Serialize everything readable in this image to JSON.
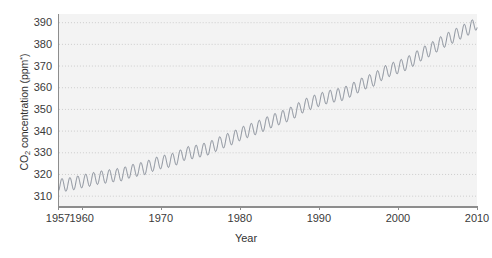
{
  "chart_data": {
    "type": "line",
    "title": "",
    "subtitle": "",
    "xlabel": "Year",
    "ylabel": "CO2 concentration (ppm*)",
    "ylabel_parts": {
      "pre": "CO",
      "sub": "2",
      "mid": " concentration (ppm",
      "sup": "*",
      "post": ")"
    },
    "xlim": [
      1957,
      2010
    ],
    "ylim": [
      305,
      394
    ],
    "grid": true,
    "grid_style": "dotted",
    "legend": "none",
    "xticks": [
      1957,
      1960,
      1970,
      1980,
      1990,
      2000,
      2010
    ],
    "xticklabels": [
      "1957",
      "1960",
      "1970",
      "1980",
      "1990",
      "2000",
      "2010"
    ],
    "yticks": [
      310,
      320,
      330,
      340,
      350,
      360,
      370,
      380,
      390
    ],
    "yticklabels": [
      "310",
      "320",
      "330",
      "340",
      "350",
      "360",
      "370",
      "380",
      "390"
    ],
    "series": [
      {
        "name": "Mauna Loa atmospheric CO2",
        "color": "#78808c",
        "description": "Monthly mean CO2 with annual seasonal cycle superimposed on a rising trend (Keeling Curve)",
        "seasonal_amplitude_ppm": 3.0,
        "x": [
          1957,
          1958,
          1959,
          1960,
          1961,
          1962,
          1963,
          1964,
          1965,
          1966,
          1967,
          1968,
          1969,
          1970,
          1971,
          1972,
          1973,
          1974,
          1975,
          1976,
          1977,
          1978,
          1979,
          1980,
          1981,
          1982,
          1983,
          1984,
          1985,
          1986,
          1987,
          1988,
          1989,
          1990,
          1991,
          1992,
          1993,
          1994,
          1995,
          1996,
          1997,
          1998,
          1999,
          2000,
          2001,
          2002,
          2003,
          2004,
          2005,
          2006,
          2007,
          2008,
          2009,
          2010
        ],
        "annual_mean": [
          315.0,
          315.3,
          316.0,
          316.9,
          317.6,
          318.5,
          319.0,
          319.6,
          320.0,
          321.4,
          322.2,
          323.0,
          324.6,
          325.7,
          326.3,
          327.5,
          329.7,
          330.2,
          331.1,
          332.0,
          333.8,
          335.4,
          336.8,
          338.7,
          340.1,
          341.4,
          343.0,
          344.6,
          346.0,
          347.4,
          349.2,
          351.6,
          353.1,
          354.4,
          355.6,
          356.4,
          357.1,
          358.8,
          360.8,
          362.6,
          363.8,
          366.6,
          368.3,
          369.5,
          371.0,
          373.1,
          375.6,
          377.4,
          379.7,
          381.9,
          383.7,
          385.6,
          387.4,
          389.8
        ]
      }
    ]
  },
  "figure": {
    "background_color": "#ffffff",
    "plot_background_color": "#f3f3f3",
    "axis_color": "#8d8d8d",
    "grid_color": "#c9c9c9",
    "line_color": "#78808c"
  }
}
